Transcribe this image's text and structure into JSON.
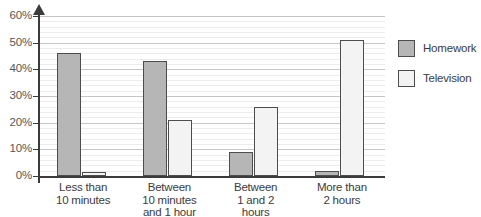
{
  "chart_data": {
    "type": "bar",
    "title": "",
    "subtitle": "",
    "xlabel": "",
    "ylabel": "",
    "ylim": [
      0,
      60
    ],
    "grid": true,
    "legend_position": "right",
    "categories": [
      "Less than 10 minutes",
      "Between 10 minutes and 1 hour",
      "Between 1 and 2 hours",
      "More than 2 hours"
    ],
    "category_lines": [
      [
        "Less than",
        "10 minutes"
      ],
      [
        "Between",
        "10 minutes",
        "and 1 hour"
      ],
      [
        "Between",
        "1 and 2",
        "hours"
      ],
      [
        "More than",
        "2 hours"
      ]
    ],
    "series": [
      {
        "name": "Homework",
        "color": "#b6b6b6",
        "values": [
          46,
          43,
          9,
          2
        ]
      },
      {
        "name": "Television",
        "color": "#f3f3f3",
        "values": [
          1.5,
          21,
          26,
          51
        ]
      }
    ],
    "y_ticks": [
      {
        "value": 0,
        "label": "0%"
      },
      {
        "value": 10,
        "label": "10%"
      },
      {
        "value": 20,
        "label": "20%"
      },
      {
        "value": 30,
        "label": "30%"
      },
      {
        "value": 40,
        "label": "40%"
      },
      {
        "value": 50,
        "label": "50%"
      },
      {
        "value": 60,
        "label": "60%"
      }
    ],
    "minor_tick_interval": 2,
    "axis_color": "#3b3b3b",
    "major_gridline_color": "#c6c6c6",
    "minor_gridline_color": "#ececec",
    "bar_border_color": "#4d4d4d"
  },
  "legend": {
    "items": [
      {
        "label": "Homework",
        "swatch": "homework"
      },
      {
        "label": "Television",
        "swatch": "television"
      }
    ]
  }
}
